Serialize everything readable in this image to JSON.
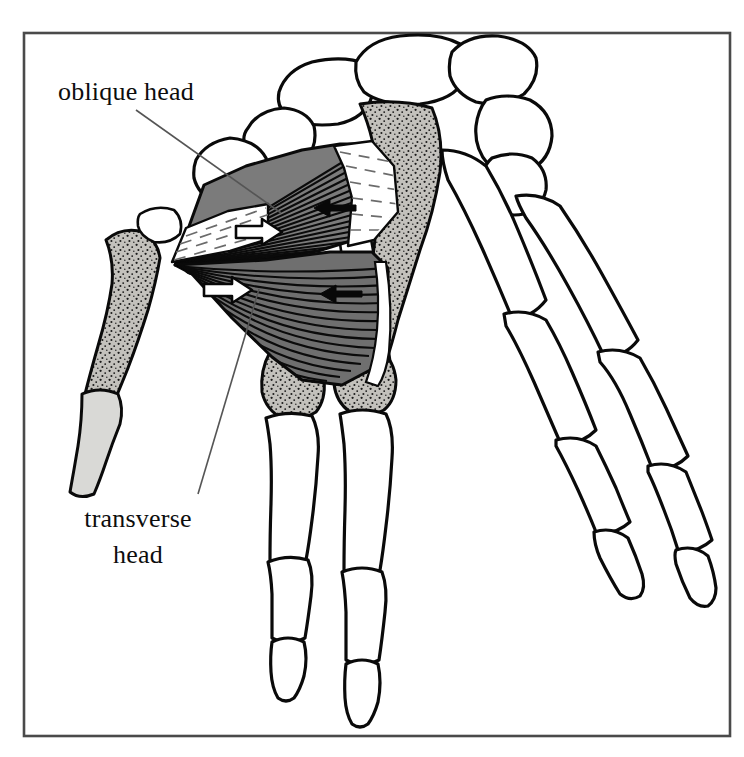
{
  "figure": {
    "frame": {
      "x": 24,
      "y": 33,
      "width": 706,
      "height": 703,
      "stroke": "#4a4a4a"
    },
    "background_color": "#ffffff",
    "ink_color": "#0a0a0a"
  },
  "labels": [
    {
      "id": "oblique-head",
      "text": "oblique head",
      "x": 58,
      "y": 100,
      "anchor": "start",
      "lines": [
        "oblique head"
      ],
      "leader": {
        "x1": 136,
        "y1": 110,
        "x2": 281,
        "y2": 213
      }
    },
    {
      "id": "transverse-head",
      "text": "transverse head",
      "x": 138,
      "y": 527,
      "anchor": "middle",
      "lines": [
        "transverse",
        "head"
      ],
      "leader": {
        "x1": 259,
        "y1": 289,
        "x2": 198,
        "y2": 494
      }
    }
  ],
  "arrows": [
    {
      "id": "arrow-oblique-pull",
      "style": "hollow",
      "direction": "right",
      "x": 240,
      "y": 233,
      "length": 42,
      "note": "white outline arrow on oblique head"
    },
    {
      "id": "arrow-oblique-counter",
      "style": "solid",
      "direction": "left",
      "x": 337,
      "y": 208,
      "length": 36,
      "note": "black arrow on oblique head"
    },
    {
      "id": "arrow-transverse-pull",
      "style": "hollow",
      "direction": "right",
      "x": 212,
      "y": 290,
      "length": 42,
      "note": "white outline arrow on transverse head"
    },
    {
      "id": "arrow-transverse-counter",
      "style": "solid",
      "direction": "left",
      "x": 342,
      "y": 294,
      "length": 36,
      "note": "black arrow on transverse head"
    }
  ],
  "muscle": {
    "name": "adductor pollicis",
    "fill_gray": "#7a7a7a",
    "fiber_stroke": "#0b0b0b",
    "apex": {
      "x": 175,
      "y": 265
    },
    "heads": [
      {
        "name": "oblique head",
        "fiber_count": 22
      },
      {
        "name": "transverse head",
        "fiber_count": 24
      }
    ]
  },
  "bones": {
    "stipple_fill": "#b9b7b2",
    "pale_fill": "#d9d9d6",
    "outline_fill": "#ffffff",
    "groups": [
      {
        "name": "carpals",
        "shaded": false
      },
      {
        "name": "third-metacarpal",
        "shaded": true
      },
      {
        "name": "thumb-metacarpal",
        "shaded": true
      },
      {
        "name": "thumb-proximal-phalanx",
        "shaded": true
      },
      {
        "name": "index-metacarpal-head",
        "shaded": true
      },
      {
        "name": "middle-metacarpal-head",
        "shaded": true
      },
      {
        "name": "sesamoid",
        "shaded": true
      },
      {
        "name": "index-finger",
        "shaded": false
      },
      {
        "name": "middle-finger",
        "shaded": false
      },
      {
        "name": "ring-finger",
        "shaded": false
      },
      {
        "name": "little-finger",
        "shaded": false
      }
    ]
  }
}
